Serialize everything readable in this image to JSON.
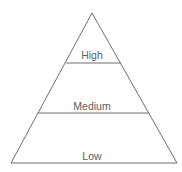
{
  "diagram": {
    "type": "pyramid",
    "tiers": [
      {
        "label": "High"
      },
      {
        "label": "Medium"
      },
      {
        "label": "Low"
      }
    ],
    "colors": {
      "line": "#6f6f6f",
      "text": "#5e5e5e",
      "background": "#ffffff"
    }
  }
}
